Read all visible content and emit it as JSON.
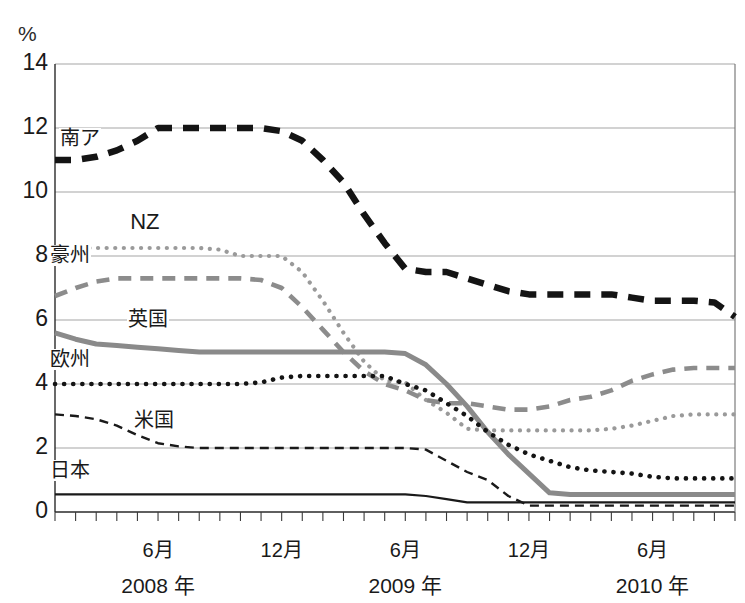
{
  "chart": {
    "unit_label": "%",
    "y_axis": {
      "ticks": [
        "0",
        "2",
        "4",
        "6",
        "8",
        "10",
        "12",
        "14"
      ],
      "min": 0,
      "max": 14
    },
    "x_axis": {
      "month_labels": [
        "6月",
        "12月",
        "6月",
        "12月",
        "6月"
      ],
      "year_labels": [
        "2008 年",
        "2009 年",
        "2010 年"
      ]
    },
    "series_labels": {
      "south_africa": "南ア",
      "new_zealand": "NZ",
      "australia": "豪州",
      "uk": "英国",
      "europe": "欧州",
      "usa": "米国",
      "japan": "日本"
    }
  },
  "chart_data": {
    "type": "line",
    "title": "",
    "subtitle": "",
    "xlabel": "",
    "ylabel": "%",
    "ylim": [
      0,
      14
    ],
    "grid": true,
    "legend": "inline-labels",
    "x_tick_labels": [
      "6月",
      "12月",
      "6月",
      "12月",
      "6月"
    ],
    "x_tick_months": [
      6,
      12,
      18,
      24,
      30
    ],
    "x_year_groups": [
      {
        "label": "2008 年",
        "center_month": 6
      },
      {
        "label": "2009 年",
        "center_month": 18
      },
      {
        "label": "2010 年",
        "center_month": 30
      }
    ],
    "x": [
      1,
      2,
      3,
      4,
      5,
      6,
      7,
      8,
      9,
      10,
      11,
      12,
      13,
      14,
      15,
      16,
      17,
      18,
      19,
      20,
      21,
      22,
      23,
      24,
      25,
      26,
      27,
      28,
      29,
      30,
      31,
      32,
      33,
      34
    ],
    "series": [
      {
        "name": "南ア",
        "key": "south_africa",
        "color": "#141414",
        "style": "dashed-thick",
        "label_x": 1.2,
        "label_y": 11.55,
        "values": [
          11.0,
          11.0,
          11.1,
          11.3,
          11.6,
          12.0,
          12.0,
          12.0,
          12.0,
          12.0,
          12.0,
          11.9,
          11.6,
          11.0,
          10.3,
          9.3,
          8.4,
          7.6,
          7.5,
          7.5,
          7.3,
          7.1,
          6.9,
          6.8,
          6.8,
          6.8,
          6.8,
          6.8,
          6.7,
          6.6,
          6.6,
          6.6,
          6.55,
          6.1
        ]
      },
      {
        "name": "NZ",
        "key": "new_zealand",
        "color": "#9a9a9a",
        "style": "dotted-thick",
        "label_x": 4.6,
        "label_y": 9.0,
        "values": [
          8.25,
          8.25,
          8.25,
          8.25,
          8.25,
          8.25,
          8.25,
          8.25,
          8.2,
          8.0,
          8.0,
          8.0,
          7.5,
          6.6,
          5.6,
          4.7,
          4.1,
          4.05,
          3.5,
          3.1,
          2.6,
          2.55,
          2.55,
          2.55,
          2.55,
          2.55,
          2.55,
          2.6,
          2.7,
          2.85,
          3.0,
          3.05,
          3.05,
          3.05
        ]
      },
      {
        "name": "豪州",
        "key": "australia",
        "color": "#8c8c8c",
        "style": "dashed-medium",
        "label_x": 0.7,
        "label_y": 7.9,
        "values": [
          6.75,
          7.0,
          7.2,
          7.3,
          7.3,
          7.3,
          7.3,
          7.3,
          7.3,
          7.3,
          7.25,
          7.0,
          6.4,
          5.7,
          5.0,
          4.4,
          4.0,
          3.8,
          3.5,
          3.4,
          3.4,
          3.3,
          3.2,
          3.2,
          3.3,
          3.5,
          3.6,
          3.8,
          4.1,
          4.3,
          4.45,
          4.5,
          4.5,
          4.5
        ]
      },
      {
        "name": "英国",
        "key": "uk",
        "color": "#8a8a8a",
        "style": "solid-thick",
        "label_x": 4.5,
        "label_y": 5.9,
        "values": [
          5.6,
          5.4,
          5.25,
          5.2,
          5.15,
          5.1,
          5.05,
          5.0,
          5.0,
          5.0,
          5.0,
          5.0,
          5.0,
          5.0,
          5.0,
          5.0,
          5.0,
          4.95,
          4.6,
          4.0,
          3.3,
          2.5,
          1.8,
          1.2,
          0.6,
          0.55,
          0.55,
          0.55,
          0.55,
          0.55,
          0.55,
          0.55,
          0.55,
          0.55
        ]
      },
      {
        "name": "欧州",
        "key": "europe",
        "color": "#141414",
        "style": "dotted-medium",
        "label_x": 0.7,
        "label_y": 4.65,
        "values": [
          4.0,
          4.0,
          4.0,
          4.0,
          4.0,
          4.0,
          4.0,
          4.0,
          4.0,
          4.0,
          4.05,
          4.2,
          4.25,
          4.25,
          4.25,
          4.25,
          4.25,
          4.0,
          3.8,
          3.4,
          3.0,
          2.5,
          2.1,
          1.8,
          1.6,
          1.4,
          1.3,
          1.25,
          1.2,
          1.1,
          1.05,
          1.05,
          1.05,
          1.05
        ]
      },
      {
        "name": "米国",
        "key": "usa",
        "color": "#1a1a1a",
        "style": "dashed-thin",
        "label_x": 4.8,
        "label_y": 2.75,
        "values": [
          3.05,
          3.0,
          2.9,
          2.7,
          2.4,
          2.15,
          2.05,
          2.0,
          2.0,
          2.0,
          2.0,
          2.0,
          2.0,
          2.0,
          2.0,
          2.0,
          2.0,
          2.0,
          1.95,
          1.6,
          1.25,
          1.0,
          0.5,
          0.2,
          0.2,
          0.2,
          0.2,
          0.2,
          0.2,
          0.2,
          0.2,
          0.2,
          0.2,
          0.2
        ]
      },
      {
        "name": "日本",
        "key": "japan",
        "color": "#1a1a1a",
        "style": "solid-thin",
        "label_x": 0.7,
        "label_y": 1.2,
        "values": [
          0.55,
          0.55,
          0.55,
          0.55,
          0.55,
          0.55,
          0.55,
          0.55,
          0.55,
          0.55,
          0.55,
          0.55,
          0.55,
          0.55,
          0.55,
          0.55,
          0.55,
          0.55,
          0.5,
          0.4,
          0.3,
          0.3,
          0.3,
          0.3,
          0.3,
          0.3,
          0.3,
          0.3,
          0.3,
          0.3,
          0.3,
          0.3,
          0.3,
          0.3
        ]
      }
    ]
  },
  "geometry": {
    "plot_left": 55,
    "plot_right": 735,
    "plot_top": 64,
    "plot_bottom": 512,
    "x_min": 1,
    "x_max": 34
  }
}
